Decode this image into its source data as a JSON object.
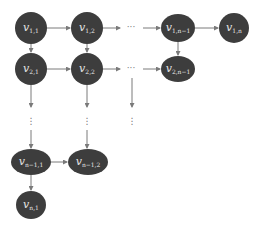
{
  "diagram": {
    "type": "directed-grid-graph",
    "colors": {
      "node_fill": "#3d3d3d",
      "edge": "#7a7a7a",
      "label": "#e6e6e6",
      "background": "#ffffff"
    },
    "nodes": [
      {
        "id": "v11",
        "base": "v",
        "sub": "1,1",
        "cx": 31,
        "cy": 28,
        "rx": 16,
        "ry": 16
      },
      {
        "id": "v12",
        "base": "v",
        "sub": "1,2",
        "cx": 87,
        "cy": 28,
        "rx": 16,
        "ry": 16
      },
      {
        "id": "v1n1",
        "base": "v",
        "sub": "1,n−1",
        "cx": 178,
        "cy": 28,
        "rx": 17,
        "ry": 14
      },
      {
        "id": "v1n",
        "base": "v",
        "sub": "1,n",
        "cx": 234,
        "cy": 28,
        "rx": 15,
        "ry": 15
      },
      {
        "id": "v21",
        "base": "v",
        "sub": "2,1",
        "cx": 31,
        "cy": 69,
        "rx": 16,
        "ry": 16
      },
      {
        "id": "v22",
        "base": "v",
        "sub": "2,2",
        "cx": 87,
        "cy": 69,
        "rx": 16,
        "ry": 16
      },
      {
        "id": "v2n1",
        "base": "v",
        "sub": "2,n−1",
        "cx": 178,
        "cy": 69,
        "rx": 17,
        "ry": 13
      },
      {
        "id": "vn11",
        "base": "v",
        "sub": "n−1,1",
        "cx": 31,
        "cy": 162,
        "rx": 20,
        "ry": 13
      },
      {
        "id": "vn12",
        "base": "v",
        "sub": "n−1,2",
        "cx": 88,
        "cy": 162,
        "rx": 20,
        "ry": 13
      },
      {
        "id": "vn1",
        "base": "v",
        "sub": "n,1",
        "cx": 31,
        "cy": 205,
        "rx": 15,
        "ry": 14
      }
    ],
    "ellipsis": {
      "horizontal": "···",
      "vertical": "⋮"
    }
  }
}
